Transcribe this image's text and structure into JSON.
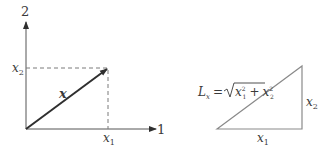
{
  "left_diagram": {
    "axis_vertical_label": "2",
    "axis_horizontal_label": "1",
    "vector_label": "x",
    "x1_label": "x",
    "x1_sub": "1",
    "x2_label": "x",
    "x2_sub": "2"
  },
  "right_diagram": {
    "formula_lhs": "L",
    "formula_lhs_sub": "x",
    "formula_eq": "=",
    "formula_var1": "x",
    "formula_var1_sup": "2",
    "formula_var1_sub": "1",
    "formula_plus": "+",
    "formula_var2": "x",
    "formula_var2_sup": "2",
    "formula_var2_sub": "2",
    "base_label": "x",
    "base_sub": "1",
    "height_label": "x",
    "height_sub": "2"
  },
  "colors": {
    "line": "#3a3a3a",
    "dash": "#7a7a7a",
    "triangle": "#8a8a8a"
  }
}
